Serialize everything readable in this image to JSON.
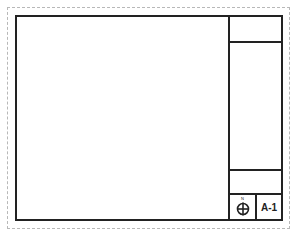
{
  "sheet": {
    "title_block": {
      "north_arrow": {
        "icon": "north-arrow-icon",
        "label": "N"
      },
      "sheet_number": "A-1"
    }
  },
  "colors": {
    "line": "#222222",
    "dashed_border": "#b8b8b8",
    "background": "#ffffff"
  }
}
